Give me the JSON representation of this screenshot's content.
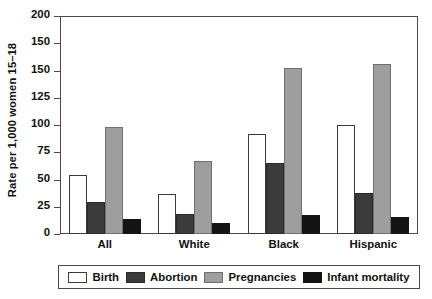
{
  "chart_data": {
    "type": "bar",
    "title": "",
    "subtitle": "",
    "xlabel": "",
    "ylabel": "Rate per 1,000 women 15–18",
    "categories": [
      "All",
      "White",
      "Black",
      "Hispanic"
    ],
    "series": [
      {
        "name": "Birth",
        "color": "#ffffff",
        "values": [
          54,
          37,
          92,
          100
        ]
      },
      {
        "name": "Abortion",
        "color": "#3b3b3b",
        "values": [
          29,
          18,
          65,
          38
        ]
      },
      {
        "name": "Pregnancies",
        "color": "#9e9e9e",
        "values": [
          98,
          67,
          152,
          156
        ]
      },
      {
        "name": "Infant mortality",
        "color": "#141414",
        "values": [
          14,
          10,
          17,
          16
        ]
      }
    ],
    "ylim": [
      0,
      200
    ],
    "ytick_values": [
      200,
      175,
      150,
      125,
      100,
      75,
      50,
      25,
      0
    ],
    "ytick_labels": [
      "200",
      "150",
      "150",
      "125",
      "100",
      "75",
      "50",
      "25",
      "0"
    ],
    "grid": false,
    "legend_position": "bottom"
  },
  "axes": {
    "y_title": "Rate per 1,000 women 15–18"
  },
  "legend": {
    "entries": [
      {
        "label": "Birth"
      },
      {
        "label": "Abortion"
      },
      {
        "label": "Pregnancies"
      },
      {
        "label": "Infant mortality"
      }
    ]
  }
}
